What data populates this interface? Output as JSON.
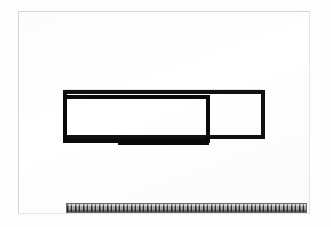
{
  "scene": {
    "background_color": "#fdfdfd",
    "description": "Photograph of a white sheet with two overlapping hand-drawn black rectangles and a ruler laid along the bottom edge"
  },
  "sheet": {
    "label": "white-paper-sheet",
    "color": "#ffffff",
    "border_color": "#d6d6d6",
    "x": 18,
    "y": 11,
    "width": 292,
    "height": 203
  },
  "figure": {
    "stroke_color": "#000000",
    "fill_color": "none",
    "stroke_width": 4,
    "shapes": [
      {
        "name": "outer-rectangle",
        "type": "rectangle",
        "x": 63,
        "y": 90,
        "width": 201,
        "height": 48
      },
      {
        "name": "inner-rectangle",
        "type": "rectangle",
        "x": 63,
        "y": 96,
        "width": 146,
        "height": 45
      },
      {
        "name": "lower-horizontal-stroke",
        "type": "line",
        "x1": 118,
        "y1": 143,
        "x2": 209,
        "y2": 143
      }
    ]
  },
  "ruler": {
    "label": "measuring-ruler",
    "body_color": "#9a9a9a",
    "tick_color": "#141414",
    "x": 66,
    "y": 203,
    "width": 241,
    "height": 10,
    "orientation": "horizontal",
    "caption": "ruler with centimetre and millimetre graduations"
  }
}
